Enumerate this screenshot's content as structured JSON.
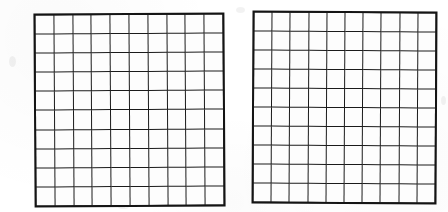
{
  "page": {
    "background_color": "#ffffff"
  },
  "style": {
    "line_color": "#1b1b1b",
    "outline_color": "#141414",
    "cell_fill": "#fdfdfd"
  },
  "figures": [
    {
      "name": "left-grid",
      "label": "Left hundred grid",
      "rows": 10,
      "columns": 10,
      "total_cells": 100,
      "filled_cells": 0,
      "cell_values": []
    },
    {
      "name": "right-grid",
      "label": "Right hundred grid",
      "rows": 10,
      "columns": 10,
      "total_cells": 100,
      "filled_cells": 0,
      "cell_values": []
    }
  ]
}
